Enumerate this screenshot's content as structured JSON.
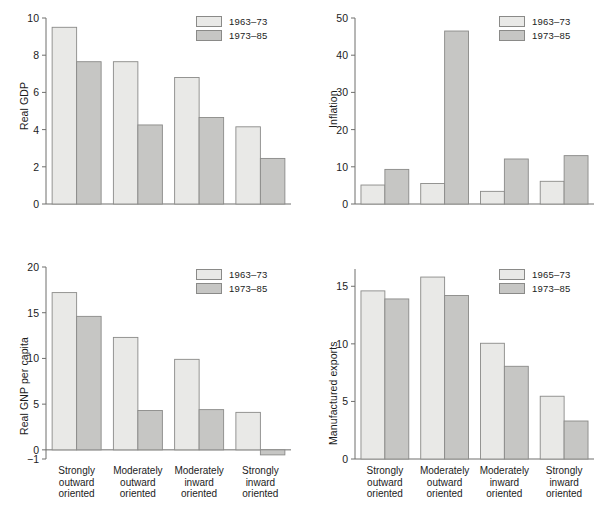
{
  "figure": {
    "background": "#ffffff",
    "series_colors": {
      "light": "#e9e9e7",
      "dark": "#c6c6c4",
      "stroke": "#8a8a88"
    },
    "categories": [
      "Strongly\noutward\noriented",
      "Moderately\noutward\noriented",
      "Moderately\ninward\noriented",
      "Strongly\ninward\noriented"
    ]
  },
  "chart_data": [
    {
      "id": "real-gdp",
      "type": "bar",
      "title": "",
      "xlabel": "",
      "ylabel": "Real GDP",
      "ylim": [
        0,
        10
      ],
      "yticks": [
        0,
        2,
        4,
        6,
        8,
        10
      ],
      "ytick_labels": [
        "0",
        "2",
        "4",
        "6",
        "8",
        "10"
      ],
      "grid": false,
      "legend_position": "top-right",
      "categories": [
        "Strongly\noutward\noriented",
        "Moderately\noutward\noriented",
        "Moderately\ninward\noriented",
        "Strongly\ninward\noriented"
      ],
      "series": [
        {
          "name": "1963–73",
          "color": "#e9e9e7",
          "values": [
            9.5,
            7.65,
            6.8,
            4.15
          ]
        },
        {
          "name": "1973–85",
          "color": "#c6c6c4",
          "values": [
            7.65,
            4.25,
            4.65,
            2.45
          ]
        }
      ]
    },
    {
      "id": "inflation",
      "type": "bar",
      "title": "",
      "xlabel": "",
      "ylabel": "Inflation",
      "ylim": [
        0,
        50
      ],
      "yticks": [
        0,
        10,
        20,
        30,
        40,
        50
      ],
      "ytick_labels": [
        "0",
        "10",
        "20",
        "30",
        "40",
        "50"
      ],
      "grid": false,
      "legend_position": "top-right",
      "categories": [
        "Strongly\noutward\noriented",
        "Moderately\noutward\noriented",
        "Moderately\ninward\noriented",
        "Strongly\ninward\noriented"
      ],
      "series": [
        {
          "name": "1963–73",
          "color": "#e9e9e7",
          "values": [
            5.1,
            5.5,
            3.4,
            6.1
          ]
        },
        {
          "name": "1973–85",
          "color": "#c6c6c4",
          "values": [
            9.3,
            46.5,
            12.1,
            13.0
          ]
        }
      ]
    },
    {
      "id": "real-gnp-per-capita",
      "type": "bar",
      "title": "",
      "xlabel": "",
      "ylabel": "Real GNP per capita",
      "ylim": [
        -1,
        20
      ],
      "yticks": [
        -1,
        0,
        5,
        10,
        15,
        20
      ],
      "ytick_labels": [
        "−1",
        "0",
        "5",
        "10",
        "15",
        "20"
      ],
      "grid": false,
      "legend_position": "top-right",
      "categories": [
        "Strongly\noutward\noriented",
        "Moderately\noutward\noriented",
        "Moderately\ninward\noriented",
        "Strongly\ninward\noriented"
      ],
      "series": [
        {
          "name": "1963–73",
          "color": "#e9e9e7",
          "values": [
            17.2,
            12.3,
            9.9,
            4.1
          ]
        },
        {
          "name": "1973–85",
          "color": "#c6c6c4",
          "values": [
            14.6,
            4.3,
            4.4,
            -0.55
          ]
        }
      ]
    },
    {
      "id": "manufactured-exports",
      "type": "bar",
      "title": "",
      "xlabel": "",
      "ylabel": "Manufactured exports",
      "ylim": [
        0,
        16.5
      ],
      "yticks": [
        0,
        5,
        10,
        15
      ],
      "ytick_labels": [
        "0",
        "5",
        "10",
        "15"
      ],
      "grid": false,
      "legend_position": "top-right",
      "categories": [
        "Strongly\noutward\noriented",
        "Moderately\noutward\noriented",
        "Moderately\ninward\noriented",
        "Strongly\ninward\noriented"
      ],
      "series": [
        {
          "name": "1965–73",
          "color": "#e9e9e7",
          "values": [
            14.6,
            15.8,
            10.05,
            5.45
          ]
        },
        {
          "name": "1973–85",
          "color": "#c6c6c4",
          "values": [
            13.9,
            14.2,
            8.05,
            3.3
          ]
        }
      ]
    }
  ]
}
